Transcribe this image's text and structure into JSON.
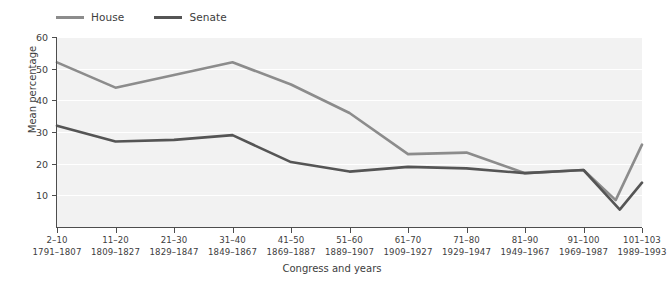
{
  "chart_data": {
    "type": "line",
    "title": "",
    "xlabel": "Congress and years",
    "ylabel": "Mean percentage",
    "ylim": [
      0,
      60
    ],
    "yticks": [
      10,
      20,
      30,
      40,
      50,
      60
    ],
    "grid": "horizontal",
    "legend_position": "top-left",
    "categories": [
      "2–10",
      "11–20",
      "21–30",
      "31–40",
      "41–50",
      "51–60",
      "61–70",
      "71–80",
      "81–90",
      "91–100",
      "101–103"
    ],
    "category_years": [
      "1791–1807",
      "1809–1827",
      "1829–1847",
      "1849–1867",
      "1869–1887",
      "1889–1907",
      "1909–1927",
      "1929–1947",
      "1949–1967",
      "1969–1987",
      "1989–1993"
    ],
    "series": [
      {
        "name": "House",
        "color": "#8c8c8c",
        "values": [
          52,
          44,
          48,
          52,
          45,
          36,
          23,
          23.5,
          17,
          18,
          26
        ],
        "extra_points": [
          {
            "x_fraction": 9.55,
            "value": 8.5
          }
        ]
      },
      {
        "name": "Senate",
        "color": "#555555",
        "values": [
          32,
          27,
          27.5,
          29,
          20.5,
          17.5,
          19,
          18.5,
          17,
          18,
          14
        ],
        "extra_points": [
          {
            "x_fraction": 9.62,
            "value": 5.5
          }
        ]
      }
    ]
  },
  "legend": {
    "items": [
      {
        "label": "House",
        "color": "#8c8c8c"
      },
      {
        "label": "Senate",
        "color": "#555555"
      }
    ]
  },
  "axes": {
    "y_label": "Mean percentage",
    "x_label": "Congress and years",
    "y_ticks": [
      "10",
      "20",
      "30",
      "40",
      "50",
      "60"
    ]
  }
}
